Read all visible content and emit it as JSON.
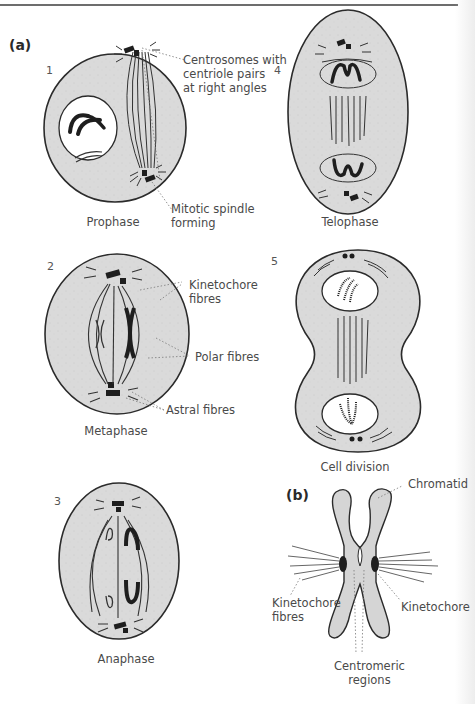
{
  "panels": {
    "a": "(a)",
    "b": "(b)"
  },
  "colors": {
    "cytoplasm": "#d9d9d9",
    "outline": "#2b2b2b",
    "chromosome": "#1e1e1e",
    "nucleus": "#ffffff",
    "label": "#4a4a4a"
  },
  "stages": [
    {
      "number": "1",
      "caption": "Prophase"
    },
    {
      "number": "2",
      "caption": "Metaphase"
    },
    {
      "number": "3",
      "caption": "Anaphase"
    },
    {
      "number": "4",
      "caption": "Telophase"
    },
    {
      "number": "5",
      "caption": "Cell division"
    }
  ],
  "labels": {
    "prophase": {
      "centrosomes": [
        "Centrosomes with",
        "centriole pairs",
        "at right angles"
      ],
      "spindle": [
        "Mitotic spindle",
        "forming"
      ]
    },
    "metaphase": {
      "kinetochore_fibres": [
        "Kinetochore",
        "fibres"
      ],
      "polar_fibres": "Polar fibres",
      "astral_fibres": "Astral fibres"
    },
    "chromosome": {
      "chromatid": "Chromatid",
      "kinetochore_fibres": [
        "Kinetochore",
        "fibres"
      ],
      "kinetochore": "Kinetochore",
      "centromeric_regions": [
        "Centromeric",
        "regions"
      ]
    }
  }
}
